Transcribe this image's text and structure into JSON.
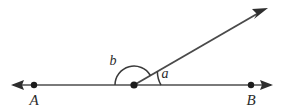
{
  "figure": {
    "kind": "geometry-angle-diagram",
    "background_color": "#ffffff",
    "line_color": "#7a7a7a",
    "ray_color": "#4a4a4a",
    "arc_color": "#3a3a3a",
    "dot_color": "#1c1c1c",
    "label_color": "#2b2b2b"
  },
  "labels": {
    "point_a": "A",
    "point_b": "B",
    "angle_a": "a",
    "angle_b": "b"
  },
  "geometry": {
    "vertex": {
      "x": 134,
      "y": 85
    },
    "point_a": {
      "x": 34,
      "y": 85
    },
    "point_b": {
      "x": 251,
      "y": 85
    },
    "line_left_tip": {
      "x": 11,
      "y": 85
    },
    "line_right_tip": {
      "x": 273,
      "y": 85
    },
    "ray_tip": {
      "x": 268,
      "y": 8
    },
    "ray_angle_degrees": 30,
    "arc_b_radius": 19,
    "arc_a_radius": 27,
    "dot_radius": 3.2
  },
  "label_positions": {
    "point_a": {
      "x": 34,
      "y": 105
    },
    "point_b": {
      "x": 251,
      "y": 105
    },
    "angle_a": {
      "x": 165,
      "y": 77
    },
    "angle_b": {
      "x": 113,
      "y": 64
    }
  }
}
